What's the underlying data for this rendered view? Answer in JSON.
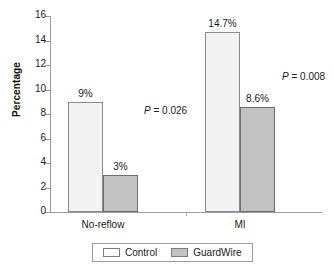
{
  "chart_data": {
    "type": "bar",
    "title": "",
    "subtitle": "",
    "xlabel": "",
    "ylabel": "Percentage",
    "categories": [
      "No-reflow",
      "MI"
    ],
    "ylim": [
      0,
      16
    ],
    "yticks": [
      0,
      2,
      4,
      6,
      8,
      10,
      12,
      14,
      16
    ],
    "ytick_labels": [
      "0",
      "2",
      "4",
      "6",
      "8",
      "10",
      "12",
      "14",
      "16"
    ],
    "grid": false,
    "legend_position": "bottom",
    "series": [
      {
        "name": "Control",
        "color": "#f2f2f2",
        "values": [
          9,
          14.7
        ],
        "data_labels": [
          "9%",
          "14.7%"
        ]
      },
      {
        "name": "GuardWire",
        "color": "#c2c2c2",
        "values": [
          3,
          8.6
        ],
        "data_labels": [
          "3%",
          "8.6%"
        ]
      }
    ],
    "annotations": [
      {
        "group": "No-reflow",
        "symbol": "P",
        "relation": "=",
        "value": "0.026",
        "text": "P = 0.026"
      },
      {
        "group": "MI",
        "symbol": "P",
        "relation": "=",
        "value": "0.008",
        "text": "P = 0.008"
      }
    ]
  },
  "legend": {
    "entries": [
      {
        "label": "Control",
        "swatch": "legend-swatch-control"
      },
      {
        "label": "GuardWire",
        "swatch": "legend-swatch-guardwire"
      }
    ]
  },
  "colors": {
    "control_fill": "#f2f2f2",
    "guardwire_fill": "#c2c2c2",
    "axis": "#9a9a9a",
    "text": "#1a1a1a"
  }
}
